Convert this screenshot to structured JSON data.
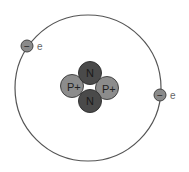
{
  "diagram": {
    "colors": {
      "background": "#ffffff",
      "orbit": "#555555",
      "proton": "#8c8c8c",
      "neutron": "#4a4a4a",
      "electron": "#8a8a8a",
      "label": "#666666"
    },
    "orbit": {
      "cx": 88,
      "cy": 88,
      "r": 73
    },
    "nucleus": {
      "particles": [
        {
          "type": "neutron",
          "label": "N",
          "cx": 90,
          "cy": 73
        },
        {
          "type": "proton",
          "label": "P+",
          "cx": 72,
          "cy": 86
        },
        {
          "type": "proton",
          "label": "P+",
          "cx": 107,
          "cy": 88
        },
        {
          "type": "neutron",
          "label": "N",
          "cx": 90,
          "cy": 101
        }
      ]
    },
    "electrons": [
      {
        "symbol": "−",
        "label": "e",
        "cx": 27,
        "cy": 46
      },
      {
        "symbol": "−",
        "label": "e",
        "cx": 160,
        "cy": 95
      }
    ]
  }
}
